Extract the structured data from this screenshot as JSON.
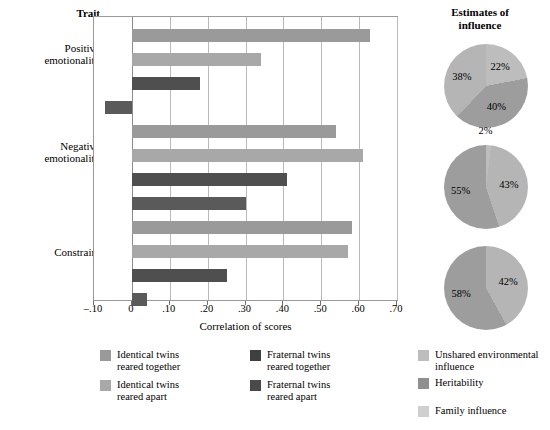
{
  "chart_data": {
    "type": "bar",
    "title": "",
    "xlabel": "Correlation of scores",
    "ylabel": "Trait",
    "xlim": [
      -0.1,
      0.7
    ],
    "grid": true,
    "orientation": "horizontal",
    "tick_labels": [
      "–.10",
      "0",
      ".10",
      ".20",
      ".30",
      ".40",
      ".50",
      ".60",
      ".70"
    ],
    "tick_values": [
      -0.1,
      0,
      0.1,
      0.2,
      0.3,
      0.4,
      0.5,
      0.6,
      0.7
    ],
    "categories": [
      "Positive emotionality",
      "Negative emotionality",
      "Constraint"
    ],
    "series": [
      {
        "name": "Identical twins reared together",
        "color": "#9a9a9a",
        "values": [
          0.63,
          0.54,
          0.58
        ]
      },
      {
        "name": "Identical twins reared apart",
        "color": "#a8a8a8",
        "values": [
          0.34,
          0.61,
          0.57
        ]
      },
      {
        "name": "Fraternal twins reared together",
        "color": "#4f4f4f",
        "values": [
          0.18,
          0.41,
          0.25
        ]
      },
      {
        "name": "Fraternal twins reared apart",
        "color": "#5a5a5a",
        "values": [
          -0.07,
          0.3,
          0.04
        ]
      }
    ],
    "legend_position": "bottom-left"
  },
  "pie_data": {
    "title": "Estimates of\ninfluence",
    "title_line1": "Estimates of",
    "title_line2": "influence",
    "type": "pie",
    "legend": [
      {
        "label": "Unshared environmental influence",
        "color": "#bdbdbd"
      },
      {
        "label": "Heritability",
        "color": "#8f8f8f"
      },
      {
        "label": "Family influence",
        "color": "#cfcfcf"
      }
    ],
    "charts": [
      {
        "name": "Positive emotionality",
        "slices": [
          {
            "label": "22%",
            "value": 22,
            "category": "Unshared environmental influence",
            "color": "#bdbdbd"
          },
          {
            "label": "40%",
            "value": 40,
            "category": "Heritability",
            "color": "#9d9d9d"
          },
          {
            "label": "38%",
            "value": 38,
            "category": "Family influence",
            "color": "#b5b5b5"
          }
        ]
      },
      {
        "name": "Negative emotionality",
        "slices": [
          {
            "label": "2%",
            "value": 2,
            "category": "Unshared environmental influence",
            "color": "#bdbdbd"
          },
          {
            "label": "43%",
            "value": 43,
            "category": "Heritability",
            "color": "#b5b5b5"
          },
          {
            "label": "55%",
            "value": 55,
            "category": "Family influence",
            "color": "#9d9d9d"
          }
        ]
      },
      {
        "name": "Constraint",
        "slices": [
          {
            "label": "42%",
            "value": 42,
            "category": "Heritability",
            "color": "#b5b5b5"
          },
          {
            "label": "58%",
            "value": 58,
            "category": "Family influence",
            "color": "#9d9d9d"
          }
        ]
      }
    ]
  },
  "labels": {
    "trait_heading": "Trait",
    "trait_positive_l1": "Positive",
    "trait_positive_l2": "emotionality",
    "trait_negative_l1": "Negative",
    "trait_negative_l2": "emotionality",
    "trait_constraint": "Constraint",
    "x_axis": "Correlation of scores"
  },
  "bar_legend": [
    {
      "l1": "Identical twins",
      "l2": "reared together",
      "color": "#9a9a9a"
    },
    {
      "l1": "Identical twins",
      "l2": "reared apart",
      "color": "#a8a8a8"
    },
    {
      "l1": "Fraternal twins",
      "l2": "reared together",
      "color": "#3f3f3f"
    },
    {
      "l1": "Fraternal twins",
      "l2": "reared apart",
      "color": "#4a4a4a"
    }
  ],
  "pie_legend_items": [
    {
      "l1": "Unshared environmental",
      "l2": "influence",
      "color": "#bdbdbd"
    },
    {
      "l1": "Heritability",
      "l2": "",
      "color": "#8f8f8f"
    },
    {
      "l1": "Family influence",
      "l2": "",
      "color": "#cfcfcf"
    }
  ]
}
